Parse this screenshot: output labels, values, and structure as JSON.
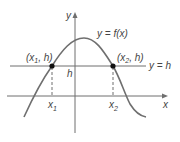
{
  "diagram": {
    "title": "",
    "axes": {
      "x_label": "x",
      "y_label": "y"
    },
    "curve_label": "y = f(x)",
    "line_label": "y = h",
    "h_label": "h",
    "points": [
      {
        "label_main": "(x",
        "label_sub": "1",
        "label_rest": ", h)",
        "axis_label": "x",
        "axis_sub": "1"
      },
      {
        "label_main": "(x",
        "label_sub": "2",
        "label_rest": ", h)",
        "axis_label": "x",
        "axis_sub": "2"
      }
    ],
    "colors": {
      "line": "#6f6f6f",
      "point": "#111111",
      "text": "#444444"
    }
  }
}
